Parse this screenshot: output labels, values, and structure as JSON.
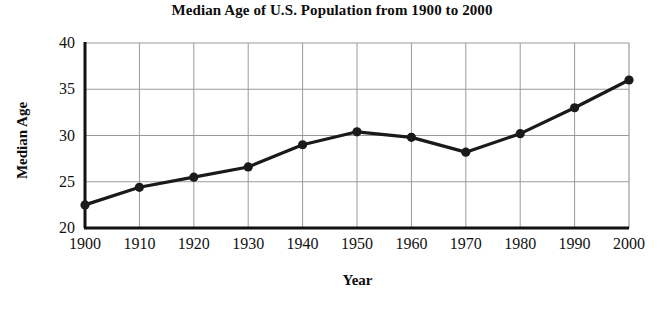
{
  "chart_data": {
    "type": "line",
    "title": "Median Age of U.S. Population from 1900 to 2000",
    "xlabel": "Year",
    "ylabel": "Median Age",
    "categories": [
      "1900",
      "1910",
      "1920",
      "1930",
      "1940",
      "1950",
      "1960",
      "1970",
      "1980",
      "1990",
      "2000"
    ],
    "x": [
      1900,
      1910,
      1920,
      1930,
      1940,
      1950,
      1960,
      1970,
      1980,
      1990,
      2000
    ],
    "values": [
      22.5,
      24.4,
      25.5,
      26.6,
      29.0,
      30.4,
      29.8,
      28.2,
      30.2,
      33.0,
      36.0
    ],
    "series": [
      {
        "name": "Median Age",
        "values": [
          22.5,
          24.4,
          25.5,
          26.6,
          29.0,
          30.4,
          29.8,
          28.2,
          30.2,
          33.0,
          36.0
        ]
      }
    ],
    "xlim": [
      1900,
      2000
    ],
    "ylim": [
      20,
      40
    ],
    "yticks": [
      20,
      25,
      30,
      35,
      40
    ],
    "ytick_labels": [
      "20",
      "25",
      "30",
      "35",
      "40"
    ],
    "xticks": [
      1900,
      1910,
      1920,
      1930,
      1940,
      1950,
      1960,
      1970,
      1980,
      1990,
      2000
    ],
    "xtick_labels": [
      "1900",
      "1910",
      "1920",
      "1930",
      "1940",
      "1950",
      "1960",
      "1970",
      "1980",
      "1990",
      "2000"
    ],
    "grid": true,
    "legend": false,
    "legend_position": "none",
    "line_color": "#1a1a1a",
    "marker": "circle",
    "marker_color": "#1a1a1a",
    "grid_color": "#9a9a9a",
    "axis_color": "#111111",
    "background_color": "#ffffff"
  }
}
